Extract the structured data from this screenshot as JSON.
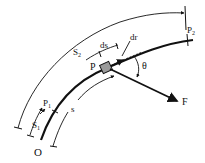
{
  "diagram": {
    "labels": {
      "origin": "O",
      "point_p": "P",
      "point_p1": "P",
      "point_p1_sub": "1",
      "point_p2": "P",
      "point_p2_sub": "2",
      "s1": "S",
      "s1_sub": "1",
      "s2": "S",
      "s2_sub": "2",
      "s": "s",
      "ds": "ds",
      "dr": "dr",
      "theta": "θ",
      "force": "F"
    },
    "colors": {
      "line": "#111111",
      "block_fill": "#9a9a9a",
      "background": "#ffffff"
    }
  }
}
